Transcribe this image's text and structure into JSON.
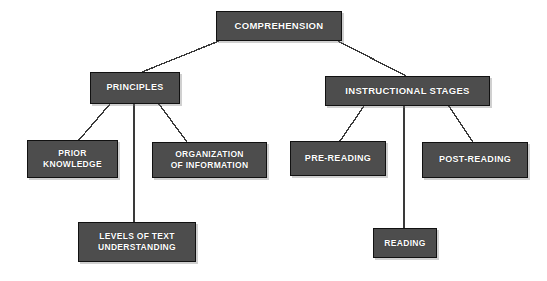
{
  "diagram": {
    "type": "tree",
    "background_color": "#ffffff",
    "node_fill_color": "#4d4d4d",
    "node_border_color": "#111111",
    "node_text_color": "#ffffff",
    "connector_color": "#3a3a3a",
    "nodes": [
      {
        "id": "comprehension",
        "label": "COMPREHENSION",
        "level": 0,
        "x": 216,
        "y": 11,
        "w": 126,
        "h": 30,
        "font_size": 9.5
      },
      {
        "id": "principles",
        "label": "PRINCIPLES",
        "level": 1,
        "x": 90,
        "y": 72,
        "w": 90,
        "h": 32,
        "font_size": 9
      },
      {
        "id": "instructional_stages",
        "label": "INSTRUCTIONAL STAGES",
        "level": 1,
        "x": 325,
        "y": 76,
        "w": 165,
        "h": 30,
        "font_size": 9.5
      },
      {
        "id": "prior_knowledge",
        "label": "PRIOR\nKNOWLEDGE",
        "level": 2,
        "x": 27,
        "y": 140,
        "w": 91,
        "h": 38,
        "font_size": 8.5
      },
      {
        "id": "organization_of_information",
        "label": "ORGANIZATION\nOF INFORMATION",
        "level": 2,
        "x": 152,
        "y": 142,
        "w": 115,
        "h": 36,
        "font_size": 8.5
      },
      {
        "id": "pre_reading",
        "label": "PRE-READING",
        "level": 2,
        "x": 290,
        "y": 141,
        "w": 96,
        "h": 35,
        "font_size": 9
      },
      {
        "id": "post_reading",
        "label": "POST-READING",
        "level": 2,
        "x": 422,
        "y": 142,
        "w": 106,
        "h": 36,
        "font_size": 9
      },
      {
        "id": "levels_of_text_understanding",
        "label": "LEVELS OF TEXT\nUNDERSTANDING",
        "level": 3,
        "x": 78,
        "y": 222,
        "w": 118,
        "h": 40,
        "font_size": 8.5
      },
      {
        "id": "reading",
        "label": "READING",
        "level": 3,
        "x": 373,
        "y": 228,
        "w": 64,
        "h": 30,
        "font_size": 8.5
      }
    ],
    "edges": [
      {
        "id": "edge-comprehension-principles",
        "from": "comprehension",
        "to": "principles",
        "x1": 219,
        "y1": 41,
        "x2": 142,
        "y2": 72
      },
      {
        "id": "edge-comprehension-instructional-stages",
        "from": "comprehension",
        "to": "instructional_stages",
        "x1": 338,
        "y1": 41,
        "x2": 406,
        "y2": 76
      },
      {
        "id": "edge-principles-prior-knowledge",
        "from": "principles",
        "to": "prior_knowledge",
        "x1": 110,
        "y1": 104,
        "x2": 79,
        "y2": 140
      },
      {
        "id": "edge-principles-levels-of-text",
        "from": "principles",
        "to": "levels_of_text_understanding",
        "x1": 134,
        "y1": 104,
        "x2": 134,
        "y2": 222
      },
      {
        "id": "edge-principles-organization",
        "from": "principles",
        "to": "organization_of_information",
        "x1": 159,
        "y1": 104,
        "x2": 187,
        "y2": 142
      },
      {
        "id": "edge-stages-pre-reading",
        "from": "instructional_stages",
        "to": "pre_reading",
        "x1": 364,
        "y1": 106,
        "x2": 340,
        "y2": 141
      },
      {
        "id": "edge-stages-reading",
        "from": "instructional_stages",
        "to": "reading",
        "x1": 404,
        "y1": 106,
        "x2": 404,
        "y2": 228
      },
      {
        "id": "edge-stages-post-reading",
        "from": "instructional_stages",
        "to": "post_reading",
        "x1": 449,
        "y1": 106,
        "x2": 473,
        "y2": 142
      }
    ]
  }
}
